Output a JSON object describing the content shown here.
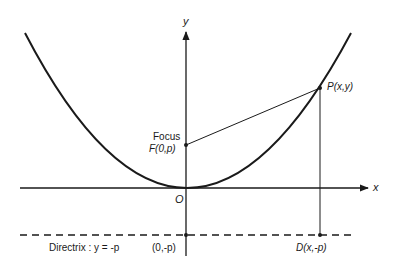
{
  "diagram": {
    "type": "parabola-focus-directrix",
    "axes": {
      "x_label": "x",
      "y_label": "y",
      "origin_label": "O"
    },
    "focus": {
      "title": "Focus",
      "label": "F(0,p)"
    },
    "point_on_curve": {
      "label": "P(x,y)"
    },
    "directrix": {
      "label": "Directrix : y = -p",
      "y_intercept_label": "(0,-p)",
      "foot_point_label": "D(x,-p)"
    },
    "colors": {
      "stroke": "#1a1a1a",
      "background": "#ffffff"
    }
  }
}
